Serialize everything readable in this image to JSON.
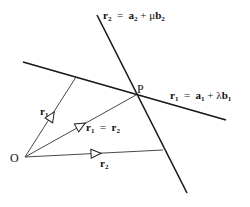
{
  "diagram": {
    "colors": {
      "line": "#1a1a1a",
      "thin": "#333333",
      "background": "#ffffff"
    },
    "points": {
      "O": {
        "label": "O",
        "x": 25,
        "y": 157
      },
      "P": {
        "label": "P",
        "x": 136,
        "y": 95
      }
    },
    "lines": [
      {
        "id": "line1",
        "label_vec": "r",
        "label_sub": "1",
        "eq": "=",
        "a": "a",
        "a_sub": "1",
        "plus": "+",
        "param": "λ",
        "b": "b",
        "b_sub": "1"
      },
      {
        "id": "line2",
        "label_vec": "r",
        "label_sub": "2",
        "eq": "=",
        "a": "a",
        "a_sub": "2",
        "plus": "+",
        "param": "μ",
        "b": "b",
        "b_sub": "2"
      }
    ],
    "vectors": [
      {
        "id": "r1",
        "label": "r",
        "sub": "1"
      },
      {
        "id": "r1eqr2",
        "label_left": "r",
        "sub_left": "1",
        "eq": "=",
        "label_right": "r",
        "sub_right": "2"
      },
      {
        "id": "r2",
        "label": "r",
        "sub": "2"
      }
    ]
  }
}
